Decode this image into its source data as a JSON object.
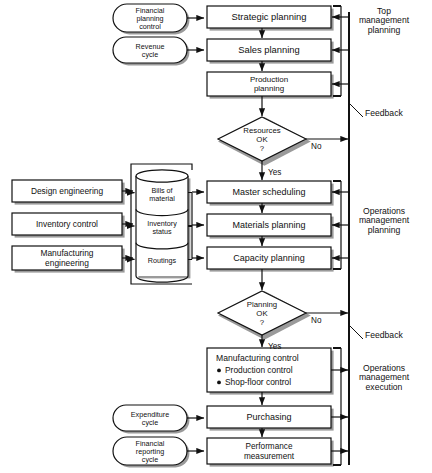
{
  "diagram": {
    "colors": {
      "stroke": "#111111",
      "fill": "#ffffff",
      "shadow": "#9a9a9a",
      "text": "#111111"
    },
    "inputs": [
      {
        "id": "financial-planning-control",
        "lines": [
          "Financial",
          "planning",
          "control"
        ],
        "x": 113,
        "y": 4,
        "w": 74,
        "h": 28
      },
      {
        "id": "revenue-cycle",
        "lines": [
          "Revenue",
          "cycle"
        ],
        "x": 113,
        "y": 37,
        "w": 74,
        "h": 26
      },
      {
        "id": "expenditure-cycle",
        "lines": [
          "Expenditure",
          "cycle"
        ],
        "x": 113,
        "y": 405,
        "w": 74,
        "h": 26
      },
      {
        "id": "financial-reporting-cycle",
        "lines": [
          "Financial",
          "reporting",
          "cycle"
        ],
        "x": 113,
        "y": 437,
        "w": 74,
        "h": 28
      }
    ],
    "sources": [
      {
        "id": "design-engineering",
        "lines": [
          "Design engineering"
        ],
        "x": 12,
        "y": 180,
        "w": 110,
        "h": 22
      },
      {
        "id": "inventory-control",
        "lines": [
          "Inventory  control"
        ],
        "x": 12,
        "y": 213,
        "w": 110,
        "h": 22
      },
      {
        "id": "manufacturing-engineering",
        "lines": [
          "Manufacturing",
          "engineering"
        ],
        "x": 12,
        "y": 246,
        "w": 110,
        "h": 24
      }
    ],
    "database": {
      "id": "mrp-database",
      "x": 136,
      "y": 176,
      "w": 52,
      "h": 100,
      "segments": [
        {
          "id": "bills-of-material",
          "lines": [
            "Bills of",
            "material"
          ]
        },
        {
          "id": "inventory-status",
          "lines": [
            "Inventory",
            "status"
          ]
        },
        {
          "id": "routings",
          "lines": [
            "Routings"
          ]
        }
      ]
    },
    "processes": [
      {
        "id": "strategic-planning",
        "lines": [
          "Strategic planning"
        ],
        "x": 207,
        "y": 6,
        "w": 124,
        "h": 22,
        "font": 9.4
      },
      {
        "id": "sales-planning",
        "lines": [
          "Sales planning"
        ],
        "x": 207,
        "y": 39,
        "w": 124,
        "h": 22,
        "font": 9.4
      },
      {
        "id": "production-planning",
        "lines": [
          "Production",
          "planning"
        ],
        "x": 207,
        "y": 72,
        "w": 124,
        "h": 24,
        "font": 8.0
      },
      {
        "id": "master-scheduling",
        "lines": [
          "Master scheduling"
        ],
        "x": 207,
        "y": 181,
        "w": 124,
        "h": 22,
        "font": 9.0
      },
      {
        "id": "materials-planning",
        "lines": [
          "Materials planning"
        ],
        "x": 207,
        "y": 214,
        "w": 124,
        "h": 22,
        "font": 9.0
      },
      {
        "id": "capacity-planning",
        "lines": [
          "Capacity planning"
        ],
        "x": 207,
        "y": 247,
        "w": 124,
        "h": 22,
        "font": 9.0
      },
      {
        "id": "purchasing",
        "lines": [
          "Purchasing"
        ],
        "x": 207,
        "y": 406,
        "w": 124,
        "h": 22,
        "font": 9.0
      },
      {
        "id": "performance-measurement",
        "lines": [
          "Performance",
          "measurement"
        ],
        "x": 207,
        "y": 438,
        "w": 124,
        "h": 26,
        "font": 8.2
      }
    ],
    "manufacturing_control": {
      "id": "manufacturing-control",
      "x": 207,
      "y": 348,
      "w": 124,
      "h": 44,
      "title": "Manufacturing  control",
      "bullets": [
        "Production control",
        "Shop-floor control"
      ]
    },
    "decisions": [
      {
        "id": "resources-ok",
        "lines": [
          "Resources",
          "OK",
          "?"
        ],
        "cx": 262,
        "cy": 139,
        "rx": 44,
        "ry": 22,
        "yes_label": "Yes",
        "no_label": "No"
      },
      {
        "id": "planning-ok",
        "lines": [
          "Planning",
          "OK",
          "?"
        ],
        "cx": 262,
        "cy": 313,
        "rx": 44,
        "ry": 22,
        "yes_label": "Yes",
        "no_label": "No"
      }
    ],
    "side_labels": [
      {
        "id": "top-management-planning",
        "lines": [
          "Top",
          "management",
          "planning"
        ],
        "x": 362,
        "y": 14
      },
      {
        "id": "feedback-upper",
        "lines": [
          "Feedback"
        ],
        "x": 365,
        "y": 116
      },
      {
        "id": "operations-management-planning",
        "lines": [
          "Operations",
          "management",
          "planning"
        ],
        "x": 362,
        "y": 214
      },
      {
        "id": "feedback-lower",
        "lines": [
          "Feedback"
        ],
        "x": 365,
        "y": 338
      },
      {
        "id": "operations-management-execution",
        "lines": [
          "Operations",
          "management",
          "execution"
        ],
        "x": 362,
        "y": 371
      }
    ]
  }
}
